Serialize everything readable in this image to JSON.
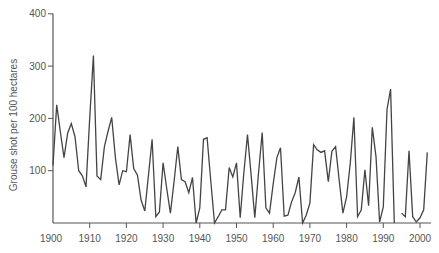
{
  "chart_data": {
    "type": "line",
    "title": "",
    "xlabel": "",
    "ylabel": "Grouse shot per 100 hectares",
    "xlim": [
      1900,
      2003
    ],
    "ylim": [
      0,
      400
    ],
    "grid": false,
    "legend": null,
    "x_ticks": [
      1900,
      1910,
      1920,
      1930,
      1940,
      1950,
      1960,
      1970,
      1980,
      1990,
      2000
    ],
    "y_ticks": [
      100,
      200,
      300,
      400
    ],
    "line_color": "#444444",
    "series": [
      {
        "name": "Grouse shot",
        "segments": [
          {
            "x": [
              1900,
              1901,
              1902,
              1903,
              1904,
              1905,
              1906,
              1907,
              1908,
              1909,
              1910,
              1911,
              1912,
              1913,
              1914,
              1915,
              1916,
              1917,
              1918,
              1919,
              1920,
              1921,
              1922,
              1923,
              1924,
              1925,
              1926,
              1927,
              1928,
              1929,
              1930,
              1931,
              1932,
              1933,
              1934,
              1935,
              1936,
              1937,
              1938,
              1939,
              1940,
              1941,
              1942,
              1943,
              1944,
              1945,
              1946,
              1947,
              1948,
              1949,
              1950,
              1951,
              1952,
              1953,
              1954,
              1955,
              1956,
              1957,
              1958,
              1959,
              1960,
              1961,
              1962,
              1963,
              1964,
              1965,
              1966,
              1967,
              1968,
              1969,
              1970,
              1971,
              1972,
              1973,
              1974,
              1975,
              1976,
              1977,
              1978,
              1979,
              1980,
              1981,
              1982,
              1983,
              1984,
              1985,
              1986,
              1987,
              1988,
              1989,
              1990,
              1991,
              1992,
              1993
            ],
            "y": [
              110,
              226,
              175,
              125,
              172,
              190,
              165,
              100,
              90,
              69,
              200,
              320,
              90,
              83,
              146,
              175,
              202,
              125,
              73,
              100,
              98,
              169,
              104,
              92,
              44,
              23,
              90,
              160,
              12,
              21,
              115,
              65,
              19,
              80,
              146,
              83,
              79,
              58,
              87,
              0,
              29,
              160,
              163,
              80,
              0,
              12,
              25,
              25,
              106,
              88,
              115,
              10,
              95,
              169,
              90,
              10,
              95,
              173,
              29,
              19,
              75,
              125,
              144,
              13,
              15,
              40,
              58,
              88,
              0,
              15,
              38,
              150,
              140,
              135,
              138,
              79,
              137,
              146,
              80,
              19,
              50,
              115,
              202,
              12,
              25,
              102,
              33,
              183,
              127,
              2,
              31,
              217,
              256,
              0
            ]
          },
          {
            "x": [
              1995,
              1996,
              1997,
              1998,
              1999,
              2000,
              2001,
              2002
            ],
            "y": [
              19,
              12,
              138,
              12,
              2,
              10,
              25,
              135
            ]
          }
        ]
      }
    ]
  },
  "axes": {
    "y_tick_labels": [
      "100",
      "200",
      "300",
      "400"
    ],
    "x_tick_labels": [
      "1900",
      "1910",
      "1920",
      "1930",
      "1940",
      "1950",
      "1960",
      "1970",
      "1980",
      "1990",
      "2000"
    ],
    "y_label": "Grouse shot per 100 hectares"
  }
}
